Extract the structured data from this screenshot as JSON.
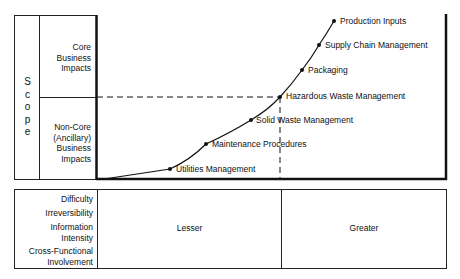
{
  "scope": {
    "title": "Scope",
    "letters": [
      "S",
      "c",
      "o",
      "p",
      "e"
    ],
    "rows": [
      {
        "label_lines": [
          "Core",
          "Business",
          "Impacts"
        ]
      },
      {
        "label_lines": [
          "Non-Core",
          "(Ancillary)",
          "Business",
          "Impacts"
        ]
      }
    ]
  },
  "curve_points": [
    {
      "label": "Utilities Management",
      "x": 170,
      "y": 169
    },
    {
      "label": "Maintenance Procedures",
      "x": 206,
      "y": 144
    },
    {
      "label": "Solid Waste Management",
      "x": 251,
      "y": 120
    },
    {
      "label": "Hazardous Waste Management",
      "x": 280,
      "y": 97
    },
    {
      "label": "Packaging",
      "x": 302,
      "y": 70
    },
    {
      "label": "Supply Chain Management",
      "x": 319,
      "y": 45
    },
    {
      "label": "Production Inputs",
      "x": 334,
      "y": 21
    }
  ],
  "bottom": {
    "criteria": [
      {
        "lines": [
          "Difficulty"
        ]
      },
      {
        "lines": [
          "Irreversibility"
        ]
      },
      {
        "lines": [
          "Information",
          "Intensity"
        ]
      },
      {
        "lines": [
          "Cross-Functional",
          "Involvement"
        ]
      }
    ],
    "columns": [
      {
        "label": "Lesser"
      },
      {
        "label": "Greater"
      }
    ]
  }
}
